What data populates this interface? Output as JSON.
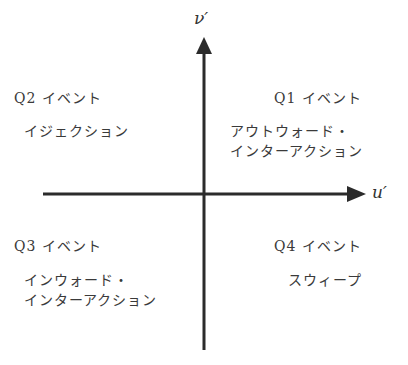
{
  "axes": {
    "x_label": "u′",
    "y_label": "ν′",
    "color": "#2b2b2b"
  },
  "quadrants": {
    "q1": {
      "title": "Q1 イベント",
      "desc_line1": "アウトウォード・",
      "desc_line2": "インターアクション"
    },
    "q2": {
      "title": "Q2 イベント",
      "desc_line1": "イジェクション"
    },
    "q3": {
      "title": "Q3 イベント",
      "desc_line1": "インウォード・",
      "desc_line2": "インターアクション"
    },
    "q4": {
      "title": "Q4 イベント",
      "desc_line1": "スウィープ"
    }
  }
}
